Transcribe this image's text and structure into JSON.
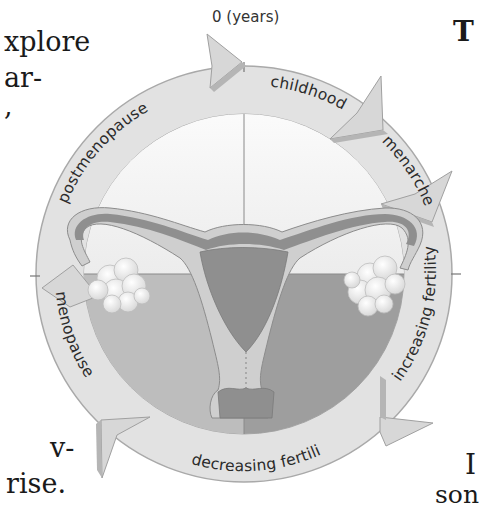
{
  "diagram": {
    "axis_label": "0 (years)",
    "stages": [
      {
        "id": "childhood",
        "label": "childhood"
      },
      {
        "id": "menarche",
        "label": "menarche"
      },
      {
        "id": "increasing-fertility",
        "label": "increasing fertility"
      },
      {
        "id": "decreasing-fertility",
        "label": "decreasing fertility"
      },
      {
        "id": "menopause",
        "label": "menopause"
      },
      {
        "id": "postmenopause",
        "label": "postmenopause"
      }
    ],
    "colors": {
      "ring": "#e0e0e0",
      "ring_edge": "#a8a8a8",
      "arrow_shadow": "#b5b5b5",
      "quadrant_top": "#f4f4f4",
      "quadrant_bottom_left": "#bdbdbd",
      "quadrant_bottom_right": "#9c9c9c",
      "uterus_body": "#8f8f8f",
      "uterus_wall": "#cfcfcf",
      "ovary": "#f7f7f7"
    }
  },
  "surrounding_text": {
    "left_lines": [
      "xplore",
      "ar-",
      ","
    ],
    "left_bottom_lines": [
      "v-",
      "rise."
    ],
    "right_top": "T",
    "right_bottom_lines": [
      "I",
      "son",
      "ted"
    ]
  }
}
